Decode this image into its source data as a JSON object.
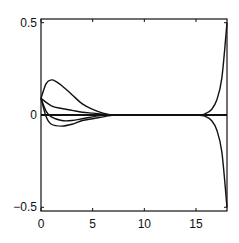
{
  "chart_data": {
    "type": "line",
    "title": "",
    "xlabel": "",
    "ylabel": "",
    "xlim": [
      0,
      18
    ],
    "ylim": [
      -0.52,
      0.52
    ],
    "grid": false,
    "legend": null,
    "x_ticks": [
      0,
      5,
      10,
      15
    ],
    "x_tick_labels": [
      "0",
      "5",
      "10",
      "15"
    ],
    "y_ticks": [
      0.5,
      0,
      -0.5
    ],
    "y_tick_labels": [
      "0.5",
      "0",
      "−0.5"
    ],
    "series": [
      {
        "name": "curve-1",
        "x": [
          0,
          0.5,
          1,
          1.5,
          2,
          3,
          4,
          5,
          6,
          7,
          8,
          10,
          15,
          18
        ],
        "values": [
          0.09,
          0.17,
          0.19,
          0.18,
          0.16,
          0.11,
          0.06,
          0.03,
          0.01,
          0.0,
          0.0,
          0.0,
          0.0,
          0.0
        ]
      },
      {
        "name": "curve-2",
        "x": [
          0,
          1,
          2,
          3,
          4,
          5,
          6,
          7,
          8,
          10,
          15,
          18
        ],
        "values": [
          0.09,
          0.05,
          0.035,
          0.025,
          0.015,
          0.01,
          0.005,
          0.0,
          0.0,
          0.0,
          0.0,
          0.0
        ]
      },
      {
        "name": "curve-3",
        "x": [
          0,
          0.5,
          1,
          2,
          3,
          4,
          5,
          6,
          7,
          8,
          10,
          15,
          18
        ],
        "values": [
          0.09,
          0.02,
          -0.01,
          -0.03,
          -0.03,
          -0.02,
          -0.01,
          0.0,
          0.0,
          0.0,
          0.0,
          0.0,
          0.0
        ]
      },
      {
        "name": "curve-4",
        "x": [
          0,
          0.5,
          1,
          2,
          3,
          4,
          5,
          6,
          7,
          8,
          10,
          15,
          18
        ],
        "values": [
          0.09,
          -0.01,
          -0.05,
          -0.06,
          -0.05,
          -0.03,
          -0.02,
          -0.01,
          0.0,
          0.0,
          0.0,
          0.0,
          0.0
        ]
      },
      {
        "name": "curve-5-upper-boundary",
        "x": [
          0,
          10,
          15,
          16,
          16.5,
          17,
          17.5,
          18
        ],
        "values": [
          0.0,
          0.0,
          0.0,
          0.01,
          0.03,
          0.08,
          0.2,
          0.5
        ]
      },
      {
        "name": "curve-6-lower-boundary",
        "x": [
          0,
          10,
          15,
          16,
          16.5,
          17,
          17.5,
          18
        ],
        "values": [
          0.0,
          0.0,
          0.0,
          -0.01,
          -0.03,
          -0.08,
          -0.2,
          -0.5
        ]
      },
      {
        "name": "zero-line",
        "x": [
          0,
          18
        ],
        "values": [
          0,
          0
        ]
      }
    ]
  },
  "style": {
    "line_color": "#111111",
    "axis_color": "#111111",
    "background": "#ffffff"
  }
}
